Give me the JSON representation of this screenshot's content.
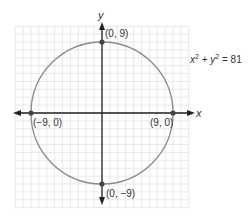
{
  "diagram": {
    "type": "circle-on-coordinate-plane",
    "equation": {
      "x_term": "x",
      "x_exp": "2",
      "plus": " + ",
      "y_term": "y",
      "y_exp": "2",
      "rhs": " = 81"
    },
    "axes": {
      "x_label": "x",
      "y_label": "y"
    },
    "circle": {
      "center": [
        0,
        0
      ],
      "radius": 9,
      "color": "#808080"
    },
    "points": [
      {
        "coords": [
          0,
          9
        ],
        "label": "(0, 9)"
      },
      {
        "coords": [
          -9,
          0
        ],
        "label": "(−9, 0)"
      },
      {
        "coords": [
          9,
          0
        ],
        "label": "(9, 0)"
      },
      {
        "coords": [
          0,
          -9
        ],
        "label": "(0, −9)"
      }
    ],
    "grid": {
      "x_range": [
        -11,
        11
      ],
      "y_range": [
        -12,
        11
      ],
      "step": 1,
      "color": "#e2e2e2"
    }
  }
}
